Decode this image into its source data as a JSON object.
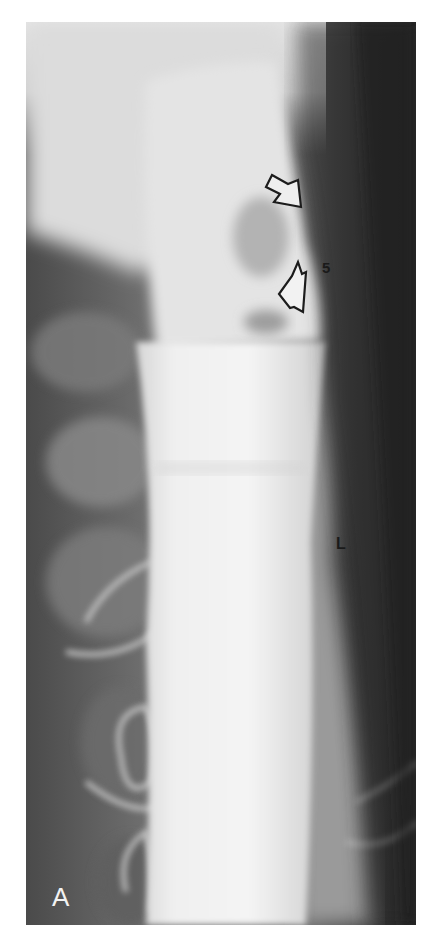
{
  "figure": {
    "panel_letter": "A",
    "labels": [
      {
        "text": "5",
        "x": 322,
        "y": 270
      },
      {
        "text": "L",
        "x": 340,
        "y": 547
      }
    ],
    "arrows": [
      {
        "name": "upper-open-arrow",
        "direction": "down-right",
        "x": 270,
        "y": 175
      },
      {
        "name": "lower-open-arrow",
        "direction": "up-right",
        "x": 277,
        "y": 265
      }
    ],
    "colors": {
      "background": "#ffffff",
      "bright_contrast": "#efefef",
      "soft_tissue": "#9a9a9a",
      "dark_field": "#2e2e2e",
      "label_dark": "#1a1a1a",
      "label_light": "#f2f2f2"
    }
  }
}
